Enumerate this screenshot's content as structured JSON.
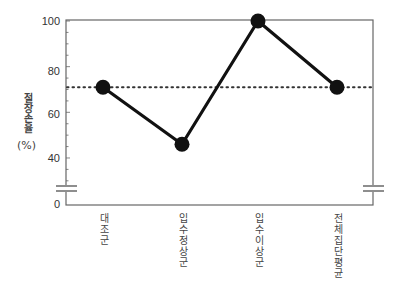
{
  "chart_data": {
    "type": "line",
    "title": "",
    "xlabel": "",
    "ylabel": "절장손율",
    "ylabel_unit": "(%)",
    "categories": [
      "대조군",
      "입수정상군",
      "입수이상군",
      "전체집단평균"
    ],
    "series": [
      {
        "name": "절장손율",
        "values": [
          71,
          46,
          100,
          71
        ]
      }
    ],
    "reference_line": {
      "value": 71,
      "style": "dotted",
      "label": "전체집단평균"
    },
    "yticks": [
      0,
      40,
      60,
      80,
      100
    ],
    "ylim": [
      0,
      100
    ],
    "axis_break": {
      "between": [
        0,
        30
      ]
    },
    "grid": false,
    "legend": "none",
    "colors": {
      "line": "#111111",
      "marker": "#111111",
      "axis": "#555555",
      "reference": "#333333"
    }
  },
  "labels": {
    "ylabel": "절장손율",
    "ylabel_unit": "(%)",
    "ytick_0": "0",
    "ytick_40": "40",
    "ytick_60": "60",
    "ytick_80": "80",
    "ytick_100": "100",
    "cat_0": "대조군",
    "cat_1": "입수정상군",
    "cat_2": "입수이상군",
    "cat_3": "전체집단평균"
  }
}
